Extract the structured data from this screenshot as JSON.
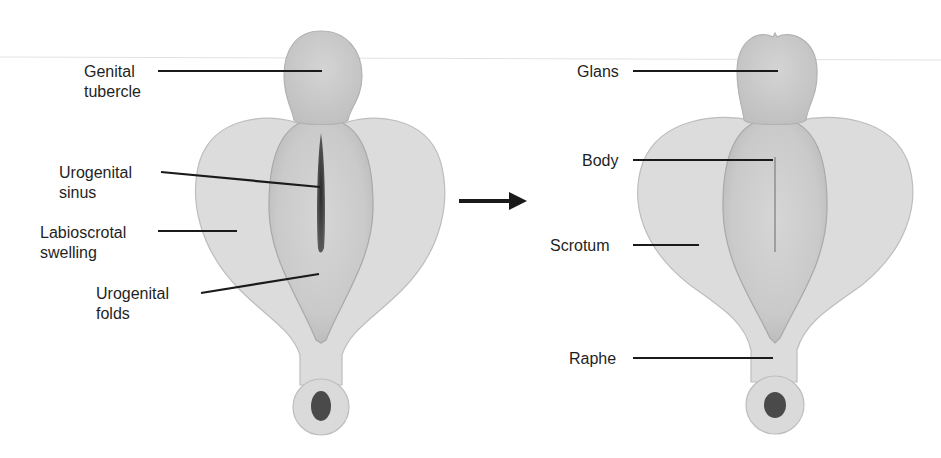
{
  "diagram": {
    "left_stage": {
      "labels": {
        "genital_tubercle_1": "Genital",
        "genital_tubercle_2": "tubercle",
        "urogenital_sinus_1": "Urogenital",
        "urogenital_sinus_2": "sinus",
        "labioscrotal_swelling_1": "Labioscrotal",
        "labioscrotal_swelling_2": "swelling",
        "urogenital_folds_1": "Urogenital",
        "urogenital_folds_2": "folds"
      }
    },
    "arrow": {
      "icon": "right-arrow-icon",
      "meaning": "develops into"
    },
    "right_stage": {
      "labels": {
        "glans": "Glans",
        "body": "Body",
        "scrotum": "Scrotum",
        "raphe": "Raphe"
      }
    },
    "colors": {
      "background": "#ffffff",
      "tissue_light": "#dcdcdc",
      "tissue_mid": "#cfcfcf",
      "tissue_dark": "#bcbcbc",
      "sinus": "#3a3a3a",
      "leader_lines": "#1a1a1a",
      "text": "#1f1f1f"
    }
  }
}
